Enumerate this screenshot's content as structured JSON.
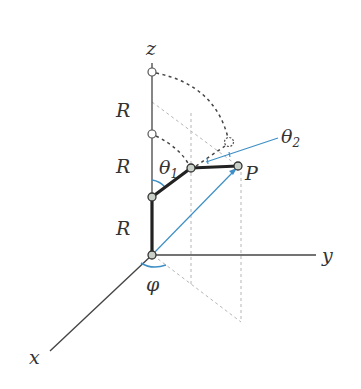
{
  "diagram": {
    "type": "robot-arm-spherical-coordinates",
    "labels": {
      "z_axis": "z",
      "y_axis": "y",
      "x_axis": "x",
      "link_length_top": "R",
      "link_length_middle": "R",
      "link_length_bottom": "R",
      "theta1": "θ",
      "theta1_sub": "1",
      "theta2": "θ",
      "theta2_sub": "2",
      "point": "P",
      "phi": "φ"
    },
    "colors": {
      "axis": "#333333",
      "arm": "#222222",
      "blue": "#3d8fc6",
      "dashed_dark": "#444444",
      "dashed_light": "#b0b0b0",
      "joint_fill": "#c8d0c8"
    },
    "points": {
      "origin": [
        152,
        255
      ],
      "z_top": [
        152,
        63
      ],
      "z_circle_top": [
        152,
        72
      ],
      "z_circle_mid": [
        152,
        134
      ],
      "shoulder": [
        152,
        197
      ],
      "elbow": [
        191,
        168
      ],
      "P": [
        238,
        166
      ],
      "dotted_circle": [
        229,
        142
      ],
      "y_end": [
        316,
        255
      ],
      "x_end": [
        50,
        351
      ]
    }
  }
}
